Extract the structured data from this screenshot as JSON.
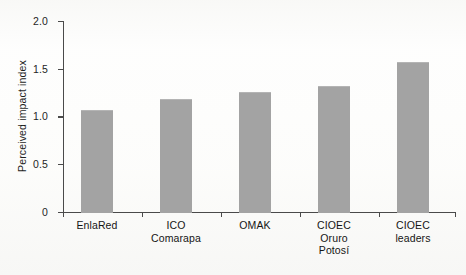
{
  "chart_data": {
    "type": "bar",
    "title": "",
    "subtitle": "",
    "xlabel": "",
    "ylabel": "Perceived impact index",
    "categories": [
      "EnlaRed",
      "ICO Comarapa",
      "OMAK",
      "CIOEC Oruro Potosí",
      "CIOEC leaders"
    ],
    "category_lines": [
      [
        "EnlaRed"
      ],
      [
        "ICO",
        "Comarapa"
      ],
      [
        "OMAK"
      ],
      [
        "CIOEC",
        "Oruro",
        "Potosí"
      ],
      [
        "CIOEC",
        "leaders"
      ]
    ],
    "values": [
      1.07,
      1.18,
      1.26,
      1.32,
      1.57
    ],
    "ylim": [
      0,
      2.0
    ],
    "yticks": [
      0,
      0.5,
      1.0,
      1.5,
      2.0
    ],
    "ytick_labels": [
      "0",
      "0.5",
      "1.0",
      "1.5",
      "2.0"
    ],
    "grid": false,
    "legend": null,
    "bar_color": "#a3a3a3",
    "axis_color": "#4a4a4a",
    "background_color": "#fdfdfc"
  }
}
